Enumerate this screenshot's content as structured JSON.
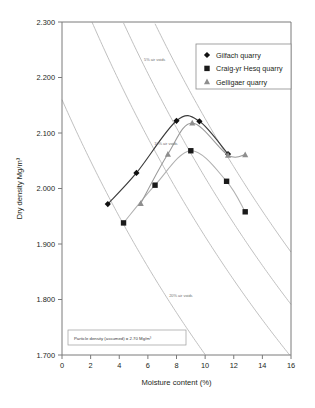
{
  "chart_data": {
    "type": "scatter",
    "title": "",
    "xlabel": "Moisture content (%)",
    "ylabel": "Dry density Mg/m³",
    "xlim": [
      0,
      16
    ],
    "ylim": [
      1.7,
      2.3
    ],
    "xticks": [
      "0",
      "2",
      "4",
      "6",
      "8",
      "10",
      "12",
      "14",
      "16"
    ],
    "yticks": [
      "1.700",
      "1.800",
      "1.900",
      "2.000",
      "2.100",
      "2.200",
      "2.300"
    ],
    "grid": false,
    "legend_position": "top-right",
    "series": [
      {
        "name": "Gilfach quarry",
        "marker": "diamond",
        "color": "#111111",
        "x": [
          3.2,
          5.2,
          8.0,
          9.6,
          11.6
        ],
        "values": [
          1.972,
          2.028,
          2.122,
          2.121,
          2.062
        ]
      },
      {
        "name": "Craig-yr Hesq quarry",
        "marker": "square",
        "color": "#1a1a1a",
        "x": [
          4.3,
          6.5,
          9.0,
          11.5,
          12.8
        ],
        "values": [
          1.938,
          2.006,
          2.068,
          2.013,
          1.958
        ]
      },
      {
        "name": "Gelligaer quarry",
        "marker": "triangle",
        "color": "#8e8e8e",
        "x": [
          5.5,
          7.4,
          9.1,
          11.6,
          12.8
        ],
        "values": [
          1.973,
          2.062,
          2.118,
          2.06,
          2.061
        ]
      }
    ],
    "air_void_lines": [
      {
        "label": "0% air voids",
        "voids": 0.0
      },
      {
        "label": "5% air voids",
        "voids": 0.05
      },
      {
        "label": "10% air voids",
        "voids": 0.1
      },
      {
        "label": "20% air voids",
        "voids": 0.2
      }
    ],
    "annotations": [
      {
        "text": "Particle density (assumed) = 2.70 Mg/m³"
      }
    ],
    "particle_density": 2.7
  },
  "legend": {
    "items": [
      {
        "label": "Gilfach quarry"
      },
      {
        "label": "Craig-yr Hesq quarry"
      },
      {
        "label": "Gelligaer quarry"
      }
    ]
  },
  "axes": {
    "x_title": "Moisture content (%)",
    "y_title": "Dry density Mg/m³"
  },
  "note": {
    "text": "Particle density (assumed) = 2.70 Mg/m³"
  }
}
